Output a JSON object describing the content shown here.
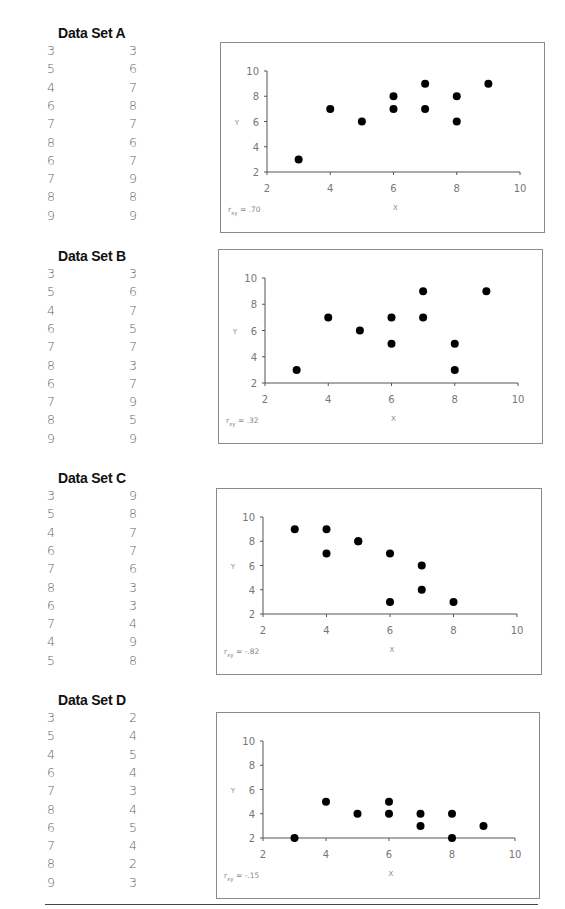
{
  "datasets": [
    {
      "title": "Data Set A",
      "x": [
        "3",
        "5",
        "4",
        "6",
        "7",
        "8",
        "6",
        "7",
        "8",
        "9"
      ],
      "y": [
        "3",
        "6",
        "7",
        "8",
        "7",
        "6",
        "7",
        "9",
        "8",
        "9"
      ],
      "r_label": "r",
      "r_sub": "xy",
      "r_value": "= .70"
    },
    {
      "title": "Data Set B",
      "x": [
        "3",
        "5",
        "4",
        "6",
        "7",
        "8",
        "6",
        "7",
        "8",
        "9"
      ],
      "y": [
        "3",
        "6",
        "7",
        "5",
        "7",
        "3",
        "7",
        "9",
        "5",
        "9"
      ],
      "r_label": "r",
      "r_sub": "xy",
      "r_value": "= .32"
    },
    {
      "title": "Data Set C",
      "x": [
        "3",
        "5",
        "4",
        "6",
        "7",
        "8",
        "6",
        "7",
        "4",
        "5"
      ],
      "y": [
        "9",
        "8",
        "7",
        "7",
        "6",
        "3",
        "3",
        "4",
        "9",
        "8"
      ],
      "r_label": "r",
      "r_sub": "xy",
      "r_value": "= -.82"
    },
    {
      "title": "Data Set D",
      "x": [
        "3",
        "5",
        "4",
        "6",
        "7",
        "8",
        "6",
        "7",
        "8",
        "9"
      ],
      "y": [
        "2",
        "4",
        "5",
        "4",
        "3",
        "4",
        "5",
        "4",
        "2",
        "3"
      ],
      "r_label": "r",
      "r_sub": "xy",
      "r_value": "= -.15"
    }
  ],
  "axes": {
    "x_label": "X",
    "y_label": "Y",
    "x_ticks": [
      "2",
      "4",
      "6",
      "8",
      "10"
    ],
    "y_ticks": [
      "2",
      "4",
      "6",
      "8",
      "10"
    ]
  },
  "chart_data": [
    {
      "type": "scatter",
      "title": "Data Set A",
      "xlabel": "X",
      "ylabel": "Y",
      "xlim": [
        2,
        10
      ],
      "ylim": [
        2,
        10
      ],
      "x": [
        3,
        5,
        4,
        6,
        7,
        8,
        6,
        7,
        8,
        9
      ],
      "y": [
        3,
        6,
        7,
        8,
        7,
        6,
        7,
        9,
        8,
        9
      ],
      "annotation": "r_xy = .70",
      "grid": false
    },
    {
      "type": "scatter",
      "title": "Data Set B",
      "xlabel": "X",
      "ylabel": "Y",
      "xlim": [
        2,
        10
      ],
      "ylim": [
        2,
        10
      ],
      "x": [
        3,
        5,
        4,
        6,
        7,
        8,
        6,
        7,
        8,
        9
      ],
      "y": [
        3,
        6,
        7,
        5,
        7,
        3,
        7,
        9,
        5,
        9
      ],
      "annotation": "r_xy = .32",
      "grid": false
    },
    {
      "type": "scatter",
      "title": "Data Set C",
      "xlabel": "X",
      "ylabel": "Y",
      "xlim": [
        2,
        10
      ],
      "ylim": [
        2,
        10
      ],
      "x": [
        3,
        5,
        4,
        6,
        7,
        8,
        6,
        7,
        4,
        5
      ],
      "y": [
        9,
        8,
        7,
        7,
        6,
        3,
        3,
        4,
        9,
        8
      ],
      "annotation": "r_xy = -.82",
      "grid": false
    },
    {
      "type": "scatter",
      "title": "Data Set D",
      "xlabel": "X",
      "ylabel": "Y",
      "xlim": [
        2,
        10
      ],
      "ylim": [
        2,
        10
      ],
      "x": [
        3,
        5,
        4,
        6,
        7,
        8,
        6,
        7,
        8,
        9
      ],
      "y": [
        2,
        4,
        5,
        4,
        3,
        4,
        5,
        4,
        2,
        3
      ],
      "annotation": "r_xy = -.15",
      "grid": false
    }
  ]
}
